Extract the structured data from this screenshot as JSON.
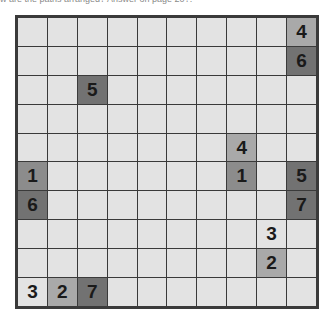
{
  "caption": "w are the paths arranged? Answer on page 20?.",
  "puzzle": {
    "rows": 10,
    "cols": 10,
    "shades": {
      "light": "#e3e3e3",
      "medium": "#a9a9a9",
      "mediumdark": "#8c8c8c",
      "dark": "#727272"
    },
    "clues": [
      {
        "row": 0,
        "col": 9,
        "value": "4",
        "shade": "medium"
      },
      {
        "row": 1,
        "col": 9,
        "value": "6",
        "shade": "dark"
      },
      {
        "row": 2,
        "col": 2,
        "value": "5",
        "shade": "dark"
      },
      {
        "row": 4,
        "col": 7,
        "value": "4",
        "shade": "medium"
      },
      {
        "row": 5,
        "col": 0,
        "value": "1",
        "shade": "mediumdark"
      },
      {
        "row": 5,
        "col": 7,
        "value": "1",
        "shade": "mediumdark"
      },
      {
        "row": 5,
        "col": 9,
        "value": "5",
        "shade": "dark"
      },
      {
        "row": 6,
        "col": 0,
        "value": "6",
        "shade": "dark"
      },
      {
        "row": 6,
        "col": 9,
        "value": "7",
        "shade": "dark"
      },
      {
        "row": 7,
        "col": 8,
        "value": "3",
        "shade": "light"
      },
      {
        "row": 8,
        "col": 8,
        "value": "2",
        "shade": "medium"
      },
      {
        "row": 9,
        "col": 0,
        "value": "3",
        "shade": "light"
      },
      {
        "row": 9,
        "col": 1,
        "value": "2",
        "shade": "medium"
      },
      {
        "row": 9,
        "col": 2,
        "value": "7",
        "shade": "dark"
      }
    ]
  }
}
